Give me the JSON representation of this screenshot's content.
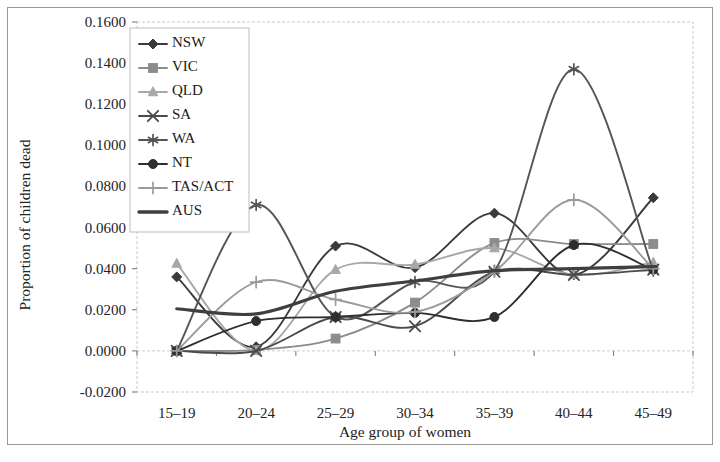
{
  "chart_data": {
    "type": "line",
    "title": "",
    "xlabel": "Age group of women",
    "ylabel": "Proportion of children dead",
    "categories": [
      "15–19",
      "20–24",
      "25–29",
      "30–34",
      "35–39",
      "40–44",
      "45–49"
    ],
    "xtick_labels": [
      "15–19",
      "20–24",
      "25–29",
      "30–34",
      "35–39",
      "40–44",
      "45–49"
    ],
    "ytick_labels": [
      "0.1600",
      "0.1400",
      "0.1200",
      "0.1000",
      "0.0800",
      "0.0600",
      "0.0400",
      "0.0200",
      "0.0000",
      "-0.0200"
    ],
    "ytick_values": [
      0.16,
      0.14,
      0.12,
      0.1,
      0.08,
      0.06,
      0.04,
      0.02,
      0.0,
      -0.02
    ],
    "ylim": [
      -0.02,
      0.16
    ],
    "ytick_step": 0.02,
    "grid": false,
    "smoothed": true,
    "legend_position": "top-left-inside",
    "series": [
      {
        "name": "NSW",
        "marker": "diamond",
        "color": "#3a3a3a",
        "values": [
          0.036,
          0.002,
          0.051,
          0.0405,
          0.067,
          0.037,
          0.0745
        ]
      },
      {
        "name": "VIC",
        "marker": "square",
        "color": "#8c8c8c",
        "values": [
          0.0,
          0.0005,
          0.006,
          0.0235,
          0.0525,
          0.052,
          0.052
        ]
      },
      {
        "name": "QLD",
        "marker": "triangle",
        "color": "#a8a8a8",
        "values": [
          0.0425,
          0.0,
          0.0395,
          0.042,
          0.05,
          0.037,
          0.043
        ]
      },
      {
        "name": "SA",
        "marker": "cross-x",
        "color": "#4a4a4a",
        "values": [
          0.0,
          0.0,
          0.0165,
          0.012,
          0.0385,
          0.037,
          0.0395
        ]
      },
      {
        "name": "WA",
        "marker": "asterisk",
        "color": "#555555",
        "values": [
          0.0,
          0.071,
          0.0165,
          0.0335,
          0.039,
          0.137,
          0.039
        ]
      },
      {
        "name": "NT",
        "marker": "circle",
        "color": "#2e2e2e",
        "values": [
          0.0,
          0.0145,
          0.0165,
          0.0185,
          0.0165,
          0.0515,
          0.0395
        ]
      },
      {
        "name": "TAS/ACT",
        "marker": "plus",
        "color": "#9b9b9b",
        "values": [
          0.0,
          0.0335,
          0.025,
          0.019,
          0.0385,
          0.0735,
          0.04
        ]
      },
      {
        "name": "AUS",
        "marker": "none",
        "color": "#3f3f3f",
        "values": [
          0.0205,
          0.018,
          0.029,
          0.034,
          0.039,
          0.04,
          0.041
        ]
      }
    ]
  },
  "axes": {
    "y_title": "Proportion of children dead",
    "x_title": "Age group of women"
  },
  "legend": {
    "items": [
      {
        "label": "NSW"
      },
      {
        "label": "VIC"
      },
      {
        "label": "QLD"
      },
      {
        "label": "SA"
      },
      {
        "label": "WA"
      },
      {
        "label": "NT"
      },
      {
        "label": "TAS/ACT"
      },
      {
        "label": "AUS"
      }
    ]
  }
}
